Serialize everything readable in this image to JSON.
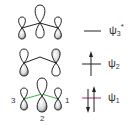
{
  "diagram": {
    "type": "molecular-orbital-diagram",
    "levels": [
      {
        "id": "psi3",
        "symbol": "ψ",
        "subscript": "3",
        "superscript": "*",
        "electrons": 0,
        "nodes": 2
      },
      {
        "id": "psi2",
        "symbol": "ψ",
        "subscript": "2",
        "superscript": "",
        "electrons": 1,
        "nodes": 1
      },
      {
        "id": "psi1",
        "symbol": "ψ",
        "subscript": "1",
        "superscript": "",
        "electrons": 2,
        "nodes": 0
      }
    ],
    "atom_labels": [
      "1",
      "2",
      "3"
    ],
    "colors": {
      "bond_bonding": "#3fae49",
      "homo_level": "#a0306a",
      "line": "#222222"
    }
  }
}
